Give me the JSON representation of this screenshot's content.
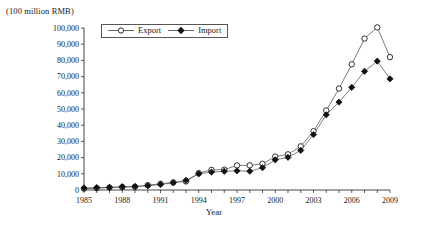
{
  "chart_data": {
    "type": "line",
    "title": "",
    "xlabel": "Year",
    "ylabel": "(100 million RMB)",
    "xlim": [
      1985,
      2009
    ],
    "ylim": [
      0,
      100000
    ],
    "ytick_step": 10000,
    "grid": false,
    "legend_position": "top-left-inside",
    "x": [
      1985,
      1986,
      1987,
      1988,
      1989,
      1990,
      1991,
      1992,
      1993,
      1994,
      1995,
      1996,
      1997,
      1998,
      1999,
      2000,
      2001,
      2002,
      2003,
      2004,
      2005,
      2006,
      2007,
      2008,
      2009
    ],
    "xticklabels": [
      "1985",
      "1988",
      "1991",
      "1994",
      "1997",
      "2000",
      "2003",
      "2006",
      "2009"
    ],
    "yticklabels": [
      "0",
      "10,000",
      "20,000",
      "30,000",
      "40,000",
      "50,000",
      "60,000",
      "70,000",
      "80,000",
      "90,000",
      "100,000"
    ],
    "series": [
      {
        "name": "Export",
        "marker": "open-circle",
        "values": [
          809,
          1082,
          1470,
          1767,
          1956,
          2986,
          3827,
          4676,
          5285,
          10422,
          12452,
          12576,
          15161,
          15224,
          16160,
          20634,
          22024,
          26948,
          36288,
          49103,
          62648,
          77595,
          93456,
          100395,
          82030
        ]
      },
      {
        "name": "Import",
        "marker": "filled-diamond",
        "values": [
          1258,
          1499,
          1614,
          2055,
          2200,
          2574,
          3399,
          4443,
          5986,
          9960,
          11048,
          11557,
          11807,
          11626,
          13737,
          18639,
          20159,
          24430,
          34196,
          46436,
          54274,
          63377,
          73285,
          79526,
          68618
        ]
      }
    ]
  },
  "legend": {
    "items": [
      {
        "label": "Export",
        "marker": "open-circle"
      },
      {
        "label": "Import",
        "marker": "filled-diamond"
      }
    ]
  }
}
